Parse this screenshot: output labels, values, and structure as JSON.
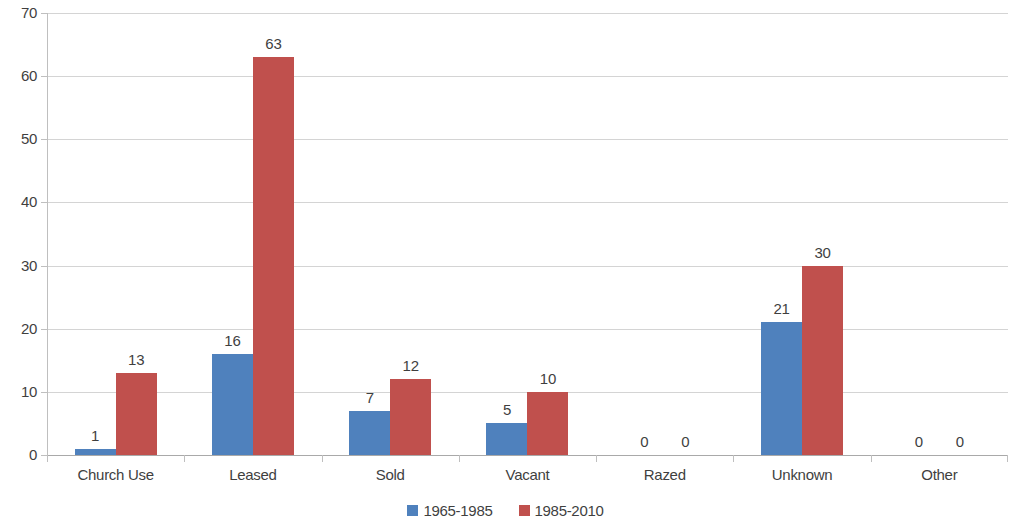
{
  "chart_data": {
    "type": "bar",
    "title": "",
    "subtitle": "",
    "xlabel": "",
    "ylabel": "",
    "ylim": [
      0,
      70
    ],
    "ytick_step": 10,
    "yticks": [
      "70",
      "60",
      "50",
      "40",
      "30",
      "20",
      "10",
      "0"
    ],
    "grid": true,
    "legend_position": "bottom",
    "categories": [
      "Church Use",
      "Leased",
      "Sold",
      "Vacant",
      "Razed",
      "Unknown",
      "Other"
    ],
    "series": [
      {
        "name": "1965-1985",
        "color": "#4F81BD",
        "values": [
          1,
          16,
          7,
          5,
          0,
          21,
          0
        ],
        "labels": [
          "1",
          "16",
          "7",
          "5",
          "0",
          "21",
          "0"
        ]
      },
      {
        "name": "1985-2010",
        "color": "#C0504D",
        "values": [
          13,
          63,
          12,
          10,
          0,
          30,
          0
        ],
        "labels": [
          "13",
          "63",
          "12",
          "10",
          "0",
          "30",
          "0"
        ]
      }
    ]
  },
  "legend": {
    "entries": [
      {
        "label": "1965-1985",
        "color": "#4F81BD"
      },
      {
        "label": "1985-2010",
        "color": "#C0504D"
      }
    ]
  },
  "colors": {
    "series_a": "#4F81BD",
    "series_b": "#C0504D",
    "gridline": "#D4D4D4",
    "axis": "#BFBFBF",
    "text": "#3F3F3F",
    "background": "#FFFFFF"
  }
}
